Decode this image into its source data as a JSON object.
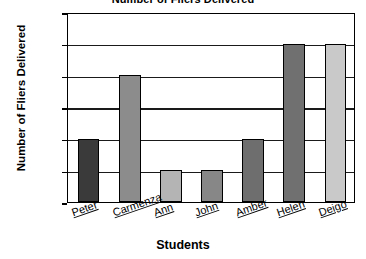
{
  "chart_data": {
    "type": "bar",
    "title": "Number of Fliers Delivered",
    "xlabel": "Students",
    "ylabel": "Number of Fliers Delivered",
    "categories": [
      "Peter",
      "Carmenza",
      "Ann",
      "John",
      "Amber",
      "Helen",
      "Deigo"
    ],
    "values": [
      100,
      200,
      50,
      50,
      100,
      250,
      250
    ],
    "ylim": [
      0,
      300
    ],
    "ytick_values": [
      0,
      50,
      100,
      150,
      200,
      250,
      300
    ],
    "ytick_labels": [
      "0",
      "50",
      "100",
      "150",
      "200",
      "250",
      "300"
    ],
    "grid": true,
    "grid_axis": "y",
    "legend": false,
    "bar_colors": [
      "#3a3a3a",
      "#8c8c8c",
      "#b4b4b4",
      "#878787",
      "#6e6e6e",
      "#707070",
      "#c9c9c9"
    ],
    "bar_edge_color": "#000000",
    "axis_color": "#000000",
    "background": "#ffffff"
  },
  "axis": {
    "y_title": "Number of Fliers Delivered",
    "x_title": "Students"
  }
}
